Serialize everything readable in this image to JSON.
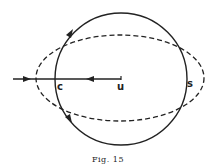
{
  "figure": {
    "caption": "Fig. 15",
    "labels": {
      "c": "c",
      "u": "u",
      "s": "s"
    },
    "elements": {
      "circle": {
        "style": "solid",
        "cx": 121,
        "cy": 79,
        "r": 66
      },
      "ellipse": {
        "style": "dashed",
        "cx": 120,
        "cy": 78,
        "rx": 85,
        "ry": 44
      },
      "line": {
        "from": [
          13,
          79
        ],
        "to": [
          121,
          79
        ],
        "arrows": [
          "right at x=28",
          "left at x=90"
        ]
      },
      "circle_arrows": [
        "upper-left arrow pointing up along circle",
        "lower-left arrow pointing down along circle"
      ]
    },
    "colors": {
      "ink": "#222222",
      "background": "#ffffff"
    }
  }
}
